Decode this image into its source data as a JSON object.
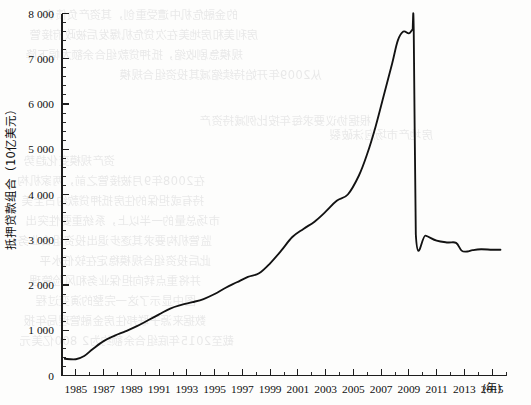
{
  "chart_data": {
    "type": "line",
    "title": "",
    "xlabel": "年",
    "ylabel": "抵押贷款组合（10亿美元）",
    "ylabel_main": "抵押贷款组合（",
    "ylabel_unit": "10",
    "ylabel_tail": "亿美元）",
    "x_unit_label": "(年)",
    "xlim": [
      1984,
      2016
    ],
    "ylim": [
      0,
      8000
    ],
    "y_major_step": 1000,
    "y_minor_step": 200,
    "x_major_step": 2,
    "x_minor_step": 1,
    "grid": false,
    "legend": "none",
    "y_ticks": [
      "0",
      "1 000",
      "2 000",
      "3 000",
      "4 000",
      "5 000",
      "6 000",
      "7 000",
      "8 000"
    ],
    "y_tick_values": [
      0,
      1000,
      2000,
      3000,
      4000,
      5000,
      6000,
      7000,
      8000
    ],
    "x_ticks": [
      "1985",
      "1987",
      "1989",
      "1991",
      "1993",
      "1995",
      "1997",
      "1999",
      "2001",
      "2003",
      "2005",
      "2007",
      "2009",
      "2011",
      "2013",
      "2015"
    ],
    "x_tick_values": [
      1985,
      1987,
      1989,
      1991,
      1993,
      1995,
      1997,
      1999,
      2001,
      2003,
      2005,
      2007,
      2009,
      2011,
      2013,
      2015
    ],
    "series": [
      {
        "name": "抵押贷款组合",
        "x": [
          1984.2,
          1985.0,
          1985.6,
          1986.2,
          1987.0,
          1987.8,
          1988.6,
          1989.4,
          1990.2,
          1991.0,
          1991.8,
          1992.6,
          1993.4,
          1994.2,
          1995.0,
          1995.8,
          1996.6,
          1997.4,
          1998.2,
          1999.0,
          1999.8,
          2000.6,
          2001.4,
          2002.2,
          2003.0,
          2003.8,
          2004.6,
          2005.4,
          2006.0,
          2006.6,
          2007.2,
          2007.8,
          2008.2,
          2008.6,
          2009.0,
          2009.25,
          2009.35,
          2009.5,
          2010.2,
          2011.0,
          2011.8,
          2012.4,
          2012.8,
          2013.2,
          2013.6,
          2014.2,
          2015.0,
          2015.6
        ],
        "y": [
          370,
          360,
          430,
          580,
          760,
          880,
          980,
          1090,
          1220,
          1350,
          1480,
          1560,
          1620,
          1690,
          1800,
          1940,
          2060,
          2180,
          2260,
          2480,
          2760,
          3060,
          3240,
          3400,
          3620,
          3860,
          4000,
          4420,
          4900,
          5500,
          6200,
          6900,
          7400,
          7600,
          7560,
          7640,
          7640,
          3120,
          3090,
          2980,
          2940,
          2930,
          2760,
          2740,
          2770,
          2790,
          2780,
          2780
        ]
      }
    ],
    "annotations": []
  },
  "bleed_text": {
    "lines": [
      {
        "t": "的金融危机中遭受重创，其资产负债表",
        "x": 44,
        "y": 6
      },
      {
        "t": "房利美和房地美在次贷危机爆发后被政府接管",
        "x": 30,
        "y": 26
      },
      {
        "t": "规模急剧收缩，抵押贷款组合余额大幅下降",
        "x": 26,
        "y": 46
      },
      {
        "t": "从2009年开始持续缩减其投资组合规模",
        "x": 120,
        "y": 66
      },
      {
        "t": "根据协议要求每年按比例减持资产",
        "x": 200,
        "y": 112
      },
      {
        "t": "房地产市场泡沫破裂",
        "x": 330,
        "y": 126
      },
      {
        "t": "资产规模变化趋势",
        "x": 24,
        "y": 152
      },
      {
        "t": "在2008年9月被接管之前，两家机构",
        "x": 18,
        "y": 172
      },
      {
        "t": "持有或担保的住房抵押贷款约占全美",
        "x": 22,
        "y": 192
      },
      {
        "t": "市场总量的一半以上，系统重要性突出",
        "x": 26,
        "y": 212
      },
      {
        "t": "监管机构要求其逐步退出投资组合业务",
        "x": 18,
        "y": 232
      },
      {
        "t": "此后投资组合规模稳定在较低水平",
        "x": 40,
        "y": 252
      },
      {
        "t": "并将重点转向担保业务和风险管理",
        "x": 30,
        "y": 272
      },
      {
        "t": "图中显示了这一完整的演变过程",
        "x": 36,
        "y": 292
      },
      {
        "t": "数据来源于联邦住房金融管理局年报",
        "x": 24,
        "y": 312
      },
      {
        "t": "截至2015年底组合余额约为2 800亿美元",
        "x": 20,
        "y": 332
      }
    ]
  }
}
